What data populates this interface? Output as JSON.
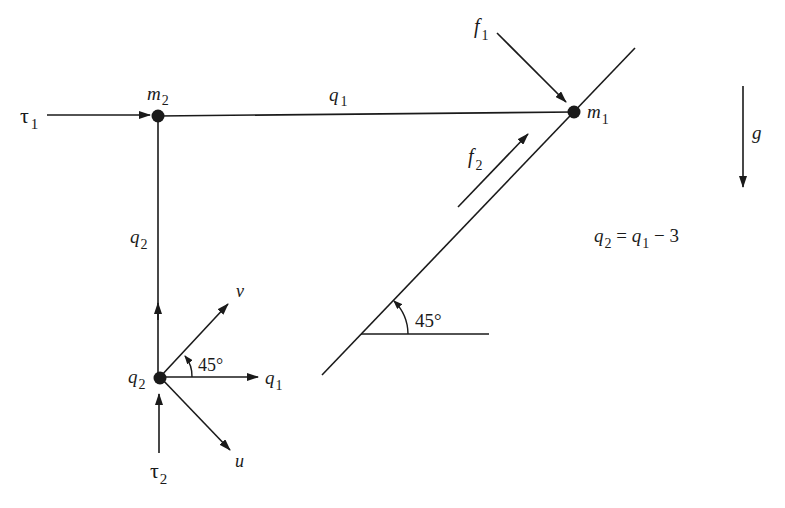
{
  "diagram": {
    "labels": {
      "tau1": {
        "base": "τ",
        "sub": "1"
      },
      "tau2": {
        "base": "τ",
        "sub": "2"
      },
      "m2": {
        "base": "m",
        "sub": "2"
      },
      "m1": {
        "base": "m",
        "sub": "1"
      },
      "q1_top": {
        "base": "q",
        "sub": "1"
      },
      "q2_left": {
        "base": "q",
        "sub": "2"
      },
      "q2_origin": {
        "base": "q",
        "sub": "2"
      },
      "q1_axis": {
        "base": "q",
        "sub": "1"
      },
      "f1": {
        "base": "f",
        "sub": "1"
      },
      "f2": {
        "base": "f",
        "sub": "2"
      },
      "g": "g",
      "v": "v",
      "u": "u",
      "angle_origin": "45°",
      "angle_incline": "45°"
    },
    "equation": {
      "lhs_base": "q",
      "lhs_sub": "2",
      "eq": " = ",
      "rhs_base": "q",
      "rhs_sub": "1",
      "rest": " − 3"
    },
    "colors": {
      "stroke": "#1a1a1a",
      "background": "#ffffff"
    }
  }
}
